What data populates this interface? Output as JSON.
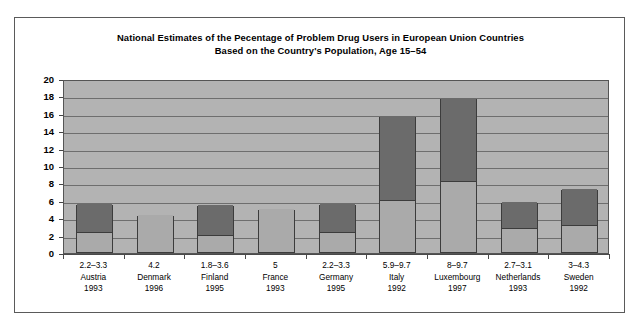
{
  "chart_data": {
    "type": "bar",
    "title": "National Estimates of the Pecentage of Problem Drug Users in European Union Countries\nBased on the Country's Population, Age 15–54",
    "title_line1": "National Estimates of the Pecentage of Problem Drug Users in European Union Countries",
    "title_line2": "Based on the Country's Population, Age 15–54",
    "xlabel": "",
    "ylabel": "",
    "ylim": [
      0,
      20
    ],
    "ytick_step": 2,
    "yticks": [
      "0",
      "2",
      "4",
      "6",
      "8",
      "10",
      "12",
      "14",
      "16",
      "18",
      "20"
    ],
    "grid": true,
    "legend": "none",
    "stacked": true,
    "note": "Each bar is a stacked range bar: light lower segment = low estimate, dark upper segment sits on top of it.",
    "categories": [
      "Austria",
      "Denmark",
      "Finland",
      "France",
      "Germany",
      "Italy",
      "Luxembourg",
      "Netherlands",
      "Sweden"
    ],
    "series": [
      {
        "name": "low estimate",
        "color": "#aaaaaa",
        "values": [
          2.2,
          4.2,
          1.8,
          5,
          2.2,
          5.9,
          8,
          2.7,
          3
        ]
      },
      {
        "name": "high estimate (stacked increment)",
        "color": "#6b6b6b",
        "values": [
          3.3,
          0,
          3.6,
          0,
          3.3,
          9.7,
          9.7,
          3.1,
          4.3
        ]
      }
    ],
    "bar_tops": [
      5.5,
      4.2,
      5.4,
      5.0,
      5.5,
      15.6,
      17.7,
      5.8,
      7.3
    ],
    "points": [
      {
        "country": "Austria",
        "range_label": "2.2–3.3",
        "year": "1993",
        "low": 2.2,
        "high": 3.3
      },
      {
        "country": "Denmark",
        "range_label": "4.2",
        "year": "1996",
        "low": 4.2,
        "high": 0
      },
      {
        "country": "Finland",
        "range_label": "1.8–3.6",
        "year": "1995",
        "low": 1.8,
        "high": 3.6
      },
      {
        "country": "France",
        "range_label": "5",
        "year": "1993",
        "low": 5,
        "high": 0
      },
      {
        "country": "Germany",
        "range_label": "2.2–3.3",
        "year": "1995",
        "low": 2.2,
        "high": 3.3
      },
      {
        "country": "Italy",
        "range_label": "5.9–9.7",
        "year": "1992",
        "low": 5.9,
        "high": 9.7
      },
      {
        "country": "Luxembourg",
        "range_label": "8–9.7",
        "year": "1997",
        "low": 8,
        "high": 9.7
      },
      {
        "country": "Netherlands",
        "range_label": "2.7–3.1",
        "year": "1993",
        "low": 2.7,
        "high": 3.1
      },
      {
        "country": "Sweden",
        "range_label": "3–4.3",
        "year": "1992",
        "low": 3,
        "high": 4.3
      }
    ],
    "colors": {
      "plot_background": "#b3b3b3",
      "gridline": "#6e6e6e",
      "bar_low": "#aaaaaa",
      "bar_high": "#6b6b6b",
      "bar_outline": "#3c3c3c",
      "frame": "#5a5a5a",
      "page_background": "#ffffff",
      "text": "#000000"
    }
  }
}
